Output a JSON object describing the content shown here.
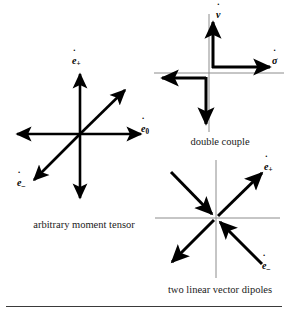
{
  "figure": {
    "background_color": "#ffffff",
    "arrow_color": "#000000",
    "axis_color": "#8c8c8c",
    "width": 288,
    "height": 311
  },
  "panels": [
    {
      "id": "arbitrary-moment-tensor",
      "caption": "arbitrary moment tensor",
      "has_axes": false,
      "labels": [
        {
          "id": "e-plus",
          "symbol": "e",
          "accent": "˙",
          "subscript": "+"
        },
        {
          "id": "e-zero",
          "symbol": "e",
          "accent": "˙",
          "subscript": "0"
        },
        {
          "id": "e-minus",
          "symbol": "e",
          "accent": "˙",
          "subscript": "–"
        }
      ],
      "arrows": [
        {
          "id": "up",
          "direction": "north",
          "points": "outward"
        },
        {
          "id": "down",
          "direction": "south",
          "points": "outward"
        },
        {
          "id": "right",
          "direction": "east",
          "points": "outward"
        },
        {
          "id": "left",
          "direction": "west",
          "points": "outward"
        },
        {
          "id": "diag-ne",
          "direction": "northeast",
          "points": "outward"
        },
        {
          "id": "diag-sw",
          "direction": "southwest",
          "points": "outward"
        }
      ]
    },
    {
      "id": "double-couple",
      "caption": "double couple",
      "has_axes": true,
      "labels": [
        {
          "id": "v-dot",
          "symbol": "v",
          "accent": "˙",
          "subscript": ""
        },
        {
          "id": "sigma-dot",
          "symbol": "σ",
          "accent": "˙",
          "subscript": ""
        }
      ],
      "arrows": [
        {
          "id": "couple-up",
          "direction": "north",
          "points": "outward"
        },
        {
          "id": "couple-right",
          "direction": "east",
          "points": "outward"
        },
        {
          "id": "couple-left",
          "direction": "west",
          "points": "outward"
        },
        {
          "id": "couple-down",
          "direction": "south",
          "points": "outward"
        }
      ]
    },
    {
      "id": "two-linear-vector-dipoles",
      "caption": "two linear vector dipoles",
      "has_axes": true,
      "labels": [
        {
          "id": "e-plus",
          "symbol": "e",
          "accent": "˙",
          "subscript": "+"
        },
        {
          "id": "e-minus",
          "symbol": "e",
          "accent": "˙",
          "subscript": "–"
        }
      ],
      "arrows": [
        {
          "id": "dipole-ne-out",
          "direction": "northeast",
          "points": "outward"
        },
        {
          "id": "dipole-sw-out",
          "direction": "southwest",
          "points": "outward"
        },
        {
          "id": "dipole-nw-in",
          "direction": "southeast",
          "points": "inward"
        },
        {
          "id": "dipole-se-in",
          "direction": "northwest",
          "points": "inward"
        }
      ]
    }
  ]
}
